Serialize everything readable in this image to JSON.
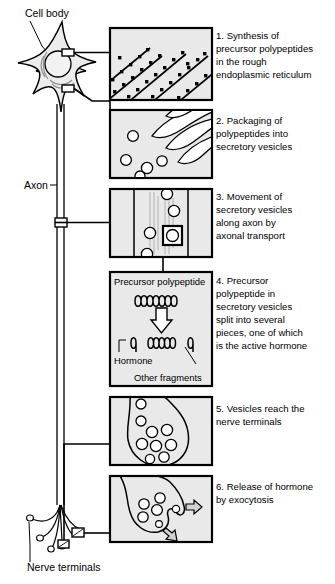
{
  "figure": {
    "background_color": "#ffffff",
    "panel_fill": "#e9e9e9",
    "ink_color": "#000000"
  },
  "anatomy_labels": {
    "cell_body": "Cell body",
    "axon": "Axon",
    "nerve_terminals": "Nerve terminals"
  },
  "panels": [
    {
      "number": "1",
      "caption_lines": [
        "1. Synthesis of",
        "precursor  polypeptides",
        "in the rough",
        "endoplasmic reticulum"
      ],
      "content": "rough-endoplasmic-reticulum-with-ribosomes"
    },
    {
      "number": "2",
      "caption_lines": [
        "2. Packaging of",
        "polypeptides into",
        "secretory vesicles"
      ],
      "content": "golgi-cisternae-budding-vesicles"
    },
    {
      "number": "3",
      "caption_lines": [
        "3. Movement of",
        "secretory vesicles",
        "along axon by",
        "axonal transport"
      ],
      "content": "axon-cross-section-with-vesicles-and-microtubules"
    },
    {
      "number": "4",
      "caption_lines": [
        "4. Precursor",
        "polypeptide in",
        "secretory vesicles",
        "split into  several",
        "pieces, one of which",
        "is the active hormone"
      ],
      "content": "polypeptide-cleavage-diagram",
      "inner_labels": {
        "top": "Precursor polypeptide",
        "hormone": "Hormone",
        "other_fragments": "Other fragments"
      }
    },
    {
      "number": "5",
      "caption_lines": [
        "5. Vesicles reach the",
        "nerve terminals"
      ],
      "content": "nerve-terminal-filled-with-vesicles"
    },
    {
      "number": "6",
      "caption_lines": [
        "6. Release of hormone",
        "by exocytosis"
      ],
      "content": "exocytosis-at-terminal-membrane"
    }
  ]
}
